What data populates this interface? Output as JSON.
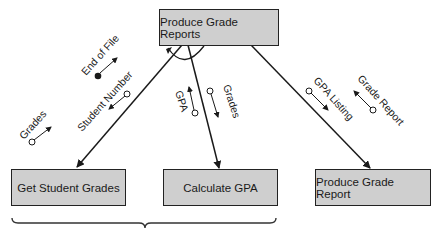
{
  "diagram": {
    "type": "structure-chart",
    "modules": {
      "top": {
        "label": "Produce Grade Reports"
      },
      "left": {
        "label": "Get Student Grades"
      },
      "middle": {
        "label": "Calculate GPA"
      },
      "right": {
        "label": "Produce Grade Report"
      }
    },
    "couples": {
      "end_of_file": {
        "label": "End of File",
        "kind": "control-flag",
        "direction": "up"
      },
      "student_number": {
        "label": "Student Number",
        "kind": "data",
        "direction": "down"
      },
      "grades_left": {
        "label": "Grades",
        "kind": "data",
        "direction": "up"
      },
      "gpa": {
        "label": "GPA",
        "kind": "data",
        "direction": "up"
      },
      "grades_middle": {
        "label": "Grades",
        "kind": "data",
        "direction": "down"
      },
      "gpa_listing": {
        "label": "GPA Listing",
        "kind": "data",
        "direction": "down"
      },
      "grade_report": {
        "label": "Grade Report",
        "kind": "data",
        "direction": "up"
      }
    },
    "loop_indicator": true,
    "brace_groups": [
      "Get Student Grades",
      "Calculate GPA"
    ],
    "colors": {
      "box_fill": "#cfcfcf",
      "line": "#1a1a1a",
      "background": "#ffffff"
    }
  }
}
